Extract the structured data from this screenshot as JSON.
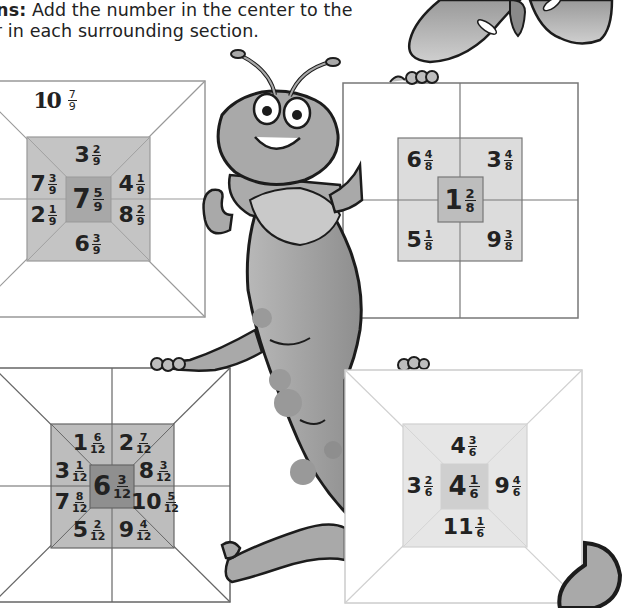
{
  "instructions": {
    "label": "ons:",
    "line1": " Add the number in the center to the",
    "line2": "er in each surrounding section."
  },
  "colors": {
    "box_line": "#8a8a8a",
    "ring_fill_dark": "#c4c4c4",
    "ring_fill_light": "#e2e2e2",
    "center_fill_dark": "#a8a8a8",
    "center_fill_light": "#cfcfcf",
    "caterpillar": "#a9a9a9",
    "outline": "#1c1c1c"
  },
  "puzzles": [
    {
      "name": "ninths",
      "answer_hint": {
        "whole": "10",
        "num": "7",
        "den": "9"
      },
      "center": {
        "whole": "7",
        "num": "5",
        "den": "9"
      },
      "sections": [
        {
          "pos": "top",
          "whole": "3",
          "num": "2",
          "den": "9"
        },
        {
          "pos": "upper-left",
          "whole": "7",
          "num": "3",
          "den": "9"
        },
        {
          "pos": "upper-right",
          "whole": "4",
          "num": "1",
          "den": "9"
        },
        {
          "pos": "lower-left",
          "whole": "2",
          "num": "1",
          "den": "9"
        },
        {
          "pos": "lower-right",
          "whole": "8",
          "num": "2",
          "den": "9"
        },
        {
          "pos": "bottom",
          "whole": "6",
          "num": "3",
          "den": "9"
        }
      ]
    },
    {
      "name": "eighths",
      "center": {
        "whole": "1",
        "num": "2",
        "den": "8"
      },
      "sections": [
        {
          "pos": "top-left",
          "whole": "6",
          "num": "4",
          "den": "8"
        },
        {
          "pos": "top-right",
          "whole": "3",
          "num": "4",
          "den": "8"
        },
        {
          "pos": "bottom-left",
          "whole": "5",
          "num": "1",
          "den": "8"
        },
        {
          "pos": "bottom-right",
          "whole": "9",
          "num": "3",
          "den": "8"
        }
      ]
    },
    {
      "name": "twelfths",
      "center": {
        "whole": "6",
        "num": "3",
        "den": "12"
      },
      "sections": [
        {
          "pos": "top-left",
          "whole": "1",
          "num": "6",
          "den": "12"
        },
        {
          "pos": "top-right",
          "whole": "2",
          "num": "7",
          "den": "12"
        },
        {
          "pos": "left-upper",
          "whole": "3",
          "num": "1",
          "den": "12"
        },
        {
          "pos": "right-upper",
          "whole": "8",
          "num": "3",
          "den": "12"
        },
        {
          "pos": "left-lower",
          "whole": "7",
          "num": "8",
          "den": "12"
        },
        {
          "pos": "right-lower",
          "whole": "10",
          "num": "5",
          "den": "12"
        },
        {
          "pos": "bottom-left",
          "whole": "5",
          "num": "2",
          "den": "12"
        },
        {
          "pos": "bottom-right",
          "whole": "9",
          "num": "4",
          "den": "12"
        }
      ]
    },
    {
      "name": "sixths",
      "center": {
        "whole": "4",
        "num": "1",
        "den": "6"
      },
      "sections": [
        {
          "pos": "top",
          "whole": "4",
          "num": "3",
          "den": "6"
        },
        {
          "pos": "left",
          "whole": "3",
          "num": "2",
          "den": "6"
        },
        {
          "pos": "right",
          "whole": "9",
          "num": "4",
          "den": "6"
        },
        {
          "pos": "bottom",
          "whole": "11",
          "num": "1",
          "den": "6"
        }
      ]
    }
  ]
}
